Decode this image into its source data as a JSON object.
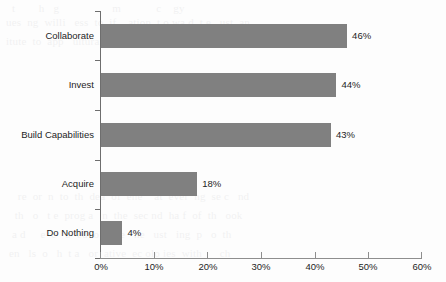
{
  "chart_data": {
    "type": "bar",
    "orientation": "horizontal",
    "title": "",
    "xlabel": "",
    "ylabel": "",
    "categories": [
      "Collaborate",
      "Invest",
      "Build Capabilities",
      "Acquire",
      "Do Nothing"
    ],
    "values": [
      46,
      44,
      43,
      18,
      4
    ],
    "value_labels": [
      "46%",
      "44%",
      "43%",
      "18%",
      "4%"
    ],
    "xlim": [
      0,
      60
    ],
    "xticks": [
      0,
      10,
      20,
      30,
      40,
      50,
      60
    ],
    "xtick_labels": [
      "0%",
      "10%",
      "20%",
      "30%",
      "40%",
      "50%",
      "60%"
    ],
    "grid": false,
    "legend": null,
    "bar_color": "#808080",
    "axis_color": "#6e6e6e",
    "text_color": "#1d1d1d",
    "background_color": "#fdfdfd"
  },
  "showthrough": {
    "line1": "t        h   g                  m            c    gy",
    "line2": "ues  ng  willi   ess  to  if    ation  t o wa d  t e   ust  an",
    "line3": "itute  to  app   ultural  capital  as  mu h  as  inte lect  cap",
    "line4": "",
    "line5": "",
    "line6": "",
    "line7": "",
    "line8": "",
    "line9": "",
    "line10": "    re  or  n  to  th  dea  of  ene    at  ever  ng  se c   nd",
    "line11": "   th   o   t e  prog a   n  the  sec nd  ha f  of  th   ook",
    "line12": "  a d     e  c   b  ed  o    the   he   ust   ing  p   o  th",
    "line13": " en   ls  o   h  t a   or  ative  ec olo ies  with      ch"
  }
}
